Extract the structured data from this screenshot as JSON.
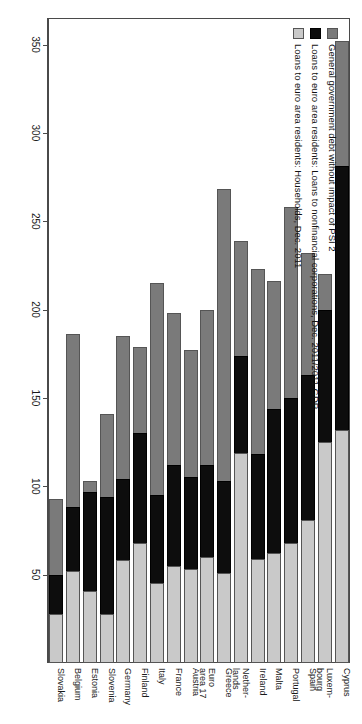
{
  "legend": {
    "position": "top-left-inside-plot",
    "items": [
      {
        "key": "gov",
        "color": "#7a7a7a",
        "label": "General government debt without impact of PSI 2"
      },
      {
        "key": "nfc",
        "color": "#0d0d0d",
        "label": "Loans to euro area residents: Loans to nonfinancial corporations, Dec. 2011/2011 GDP"
      },
      {
        "key": "hh",
        "color": "#c9c9c9",
        "label": "Loans to euro area residents: Households, Dec. 2011"
      }
    ]
  },
  "axis": {
    "ticks": [
      350,
      300,
      250,
      200,
      150,
      100,
      50
    ],
    "tick_labels": [
      "350",
      "300",
      "250",
      "200",
      "150",
      "100",
      "50"
    ],
    "max": 365,
    "min": 0,
    "orientation": "horizontal-value-axis-reversed"
  },
  "chart_data": {
    "type": "bar",
    "orientation": "horizontal-stacked",
    "title": "",
    "xlabel": "",
    "ylabel": "",
    "xlim": [
      0,
      365
    ],
    "grid": false,
    "legend_position": "top-left",
    "categories": [
      "Cyprus",
      "Luxem-\nbourg",
      "Spain",
      "Portugal",
      "Malta",
      "Ireland",
      "Nether-\nlands",
      "Greece",
      "Euro\narea 17",
      "Austria",
      "France",
      "Italy",
      "Finland",
      "Germany",
      "Slovenia",
      "Estonia",
      "Belgium",
      "Slovakia"
    ],
    "series": [
      {
        "name": "General government debt without impact of PSI 2",
        "color": "#7a7a7a",
        "values": [
          71,
          20,
          69,
          108,
          72,
          105,
          65,
          165,
          88,
          72,
          86,
          120,
          49,
          81,
          47,
          6,
          98,
          43
        ]
      },
      {
        "name": "Loans to euro area residents: Loans to nonfinancial corporations, Dec. 2011/2011 GDP",
        "color": "#0d0d0d",
        "values": [
          149,
          75,
          82,
          82,
          82,
          59,
          55,
          52,
          52,
          52,
          57,
          50,
          62,
          46,
          66,
          56,
          36,
          22
        ]
      },
      {
        "name": "Loans to euro area residents: Households, Dec. 2011",
        "color": "#c9c9c9",
        "values": [
          132,
          125,
          81,
          68,
          62,
          59,
          119,
          51,
          60,
          53,
          55,
          45,
          68,
          58,
          28,
          41,
          52,
          28
        ]
      }
    ],
    "totals": [
      352,
      220,
      232,
      258,
      216,
      223,
      239,
      268,
      200,
      177,
      198,
      215,
      179,
      185,
      141,
      103,
      186,
      93
    ]
  }
}
